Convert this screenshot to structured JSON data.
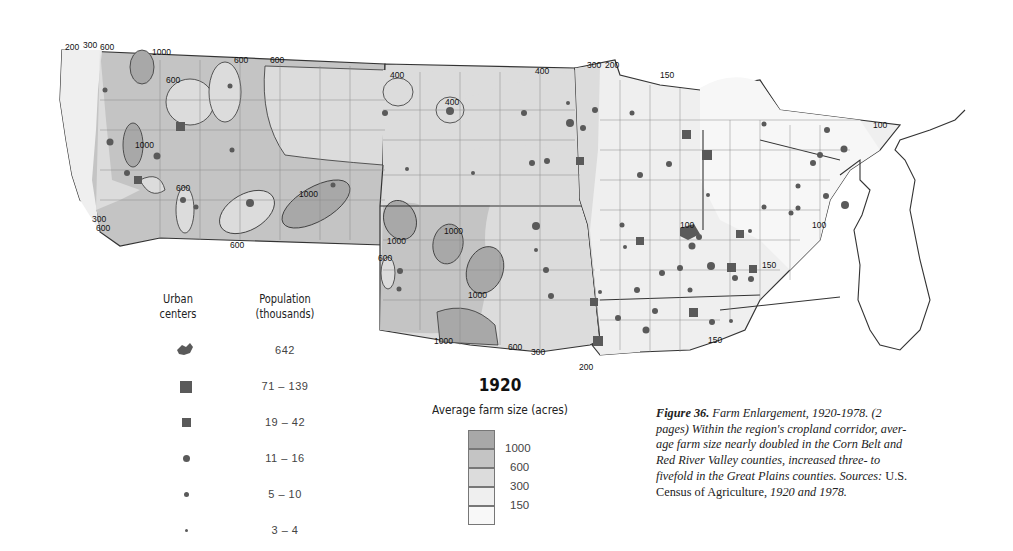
{
  "map": {
    "year": "1920",
    "title": "Average farm size (acres)",
    "colors": {
      "c1000": "#a8a8a8",
      "c600": "#c4c4c4",
      "c300": "#dcdcdc",
      "c150": "#efefef",
      "c100": "#f7f7f7",
      "border": "#333333",
      "county": "#8a8a8a",
      "symbol": "#5a5a5a"
    },
    "isoline_labels": [
      {
        "text": "200",
        "x": 65,
        "y": 50
      },
      {
        "text": "300",
        "x": 83,
        "y": 48
      },
      {
        "text": "600",
        "x": 100,
        "y": 50
      },
      {
        "text": "1000",
        "x": 152,
        "y": 55
      },
      {
        "text": "600",
        "x": 234,
        "y": 63
      },
      {
        "text": "600",
        "x": 270,
        "y": 63
      },
      {
        "text": "600",
        "x": 166,
        "y": 83
      },
      {
        "text": "1000",
        "x": 135,
        "y": 148
      },
      {
        "text": "600",
        "x": 176,
        "y": 191
      },
      {
        "text": "1000",
        "x": 299,
        "y": 197
      },
      {
        "text": "600",
        "x": 230,
        "y": 248
      },
      {
        "text": "300",
        "x": 92,
        "y": 222
      },
      {
        "text": "600",
        "x": 96,
        "y": 231
      },
      {
        "text": "400",
        "x": 390,
        "y": 78
      },
      {
        "text": "400",
        "x": 445,
        "y": 105
      },
      {
        "text": "400",
        "x": 535,
        "y": 74
      },
      {
        "text": "300",
        "x": 587,
        "y": 68
      },
      {
        "text": "200",
        "x": 605,
        "y": 68
      },
      {
        "text": "1000",
        "x": 387,
        "y": 244
      },
      {
        "text": "1000",
        "x": 444,
        "y": 234
      },
      {
        "text": "600",
        "x": 378,
        "y": 261
      },
      {
        "text": "1000",
        "x": 468,
        "y": 298
      },
      {
        "text": "1000",
        "x": 434,
        "y": 344
      },
      {
        "text": "600",
        "x": 508,
        "y": 350
      },
      {
        "text": "300",
        "x": 531,
        "y": 355
      },
      {
        "text": "200",
        "x": 579,
        "y": 370
      },
      {
        "text": "150",
        "x": 660,
        "y": 78
      },
      {
        "text": "100",
        "x": 873,
        "y": 128
      },
      {
        "text": "100",
        "x": 812,
        "y": 228
      },
      {
        "text": "100",
        "x": 680,
        "y": 228
      },
      {
        "text": "150",
        "x": 762,
        "y": 268
      },
      {
        "text": "150",
        "x": 708,
        "y": 343
      }
    ]
  },
  "legend_urban": {
    "header_col1": [
      "Urban",
      "centers"
    ],
    "header_col2": [
      "Population",
      "(thousands)"
    ],
    "rows": [
      {
        "symbol": "city-shape",
        "label": "642"
      },
      {
        "symbol": "large-square",
        "label": "71 – 139"
      },
      {
        "symbol": "small-square",
        "label": "19 – 42"
      },
      {
        "symbol": "large-dot",
        "label": "11 – 16"
      },
      {
        "symbol": "medium-dot",
        "label": "5 – 10"
      },
      {
        "symbol": "small-dot",
        "label": "3 – 4"
      }
    ]
  },
  "legend_farm": {
    "year": "1920",
    "title": "Average farm size (acres)",
    "classes": [
      {
        "label": "1000",
        "color": "#a8a8a8"
      },
      {
        "label": "600",
        "color": "#c4c4c4"
      },
      {
        "label": "300",
        "color": "#dcdcdc"
      },
      {
        "label": "150",
        "color": "#efefef"
      },
      {
        "label": "",
        "color": "#f8f8f8"
      }
    ]
  },
  "caption": {
    "figure": "Figure 36.",
    "title": " Farm Enlargement, 1920-1978. (2 pages) Within the region's cropland corridor, aver-age farm size nearly doubled in the Corn Belt and Red River Valley counties, increased three- to fivefold in the Great Plains counties. Sources: ",
    "source_plain": "U.S. Census of Agriculture, ",
    "source_italic": "1920 and 1978."
  }
}
